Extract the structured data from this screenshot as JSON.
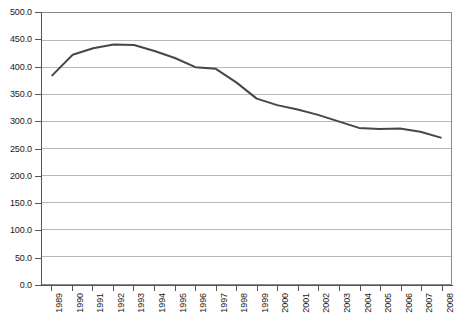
{
  "chart_data": {
    "type": "line",
    "title": "",
    "subtitle": "",
    "xlabel": "",
    "ylabel": "",
    "categories": [
      "1989",
      "1990",
      "1991",
      "1992",
      "1993",
      "1994",
      "1995",
      "1996",
      "1997",
      "1998",
      "1999",
      "2000",
      "2001",
      "2002",
      "2003",
      "2004",
      "2005",
      "2006",
      "2007",
      "2008"
    ],
    "values": [
      385.0,
      423.0,
      435.0,
      442.0,
      441.0,
      430.0,
      417.0,
      400.0,
      397.0,
      372.0,
      342.0,
      330.0,
      322.0,
      312.0,
      300.0,
      288.0,
      286.0,
      287.0,
      281.0,
      270.0
    ],
    "series": [
      {
        "name": "series-1",
        "values": [
          385.0,
          423.0,
          435.0,
          442.0,
          441.0,
          430.0,
          417.0,
          400.0,
          397.0,
          372.0,
          342.0,
          330.0,
          322.0,
          312.0,
          300.0,
          288.0,
          286.0,
          287.0,
          281.0,
          270.0
        ]
      }
    ],
    "ylim": [
      0,
      500
    ],
    "ytick_values": [
      0.0,
      50.0,
      100.0,
      150.0,
      200.0,
      250.0,
      300.0,
      350.0,
      400.0,
      450.0,
      500.0
    ],
    "ytick_labels": [
      "0.0",
      "50.0",
      "100.0",
      "150.0",
      "200.0",
      "250.0",
      "300.0",
      "350.0",
      "400.0",
      "450.0",
      "500.0"
    ],
    "grid": true,
    "grid_axis": "y",
    "legend": false,
    "legend_position": "none",
    "line_color": "#474747",
    "grid_color": "#b8b8b8",
    "axis_color": "#555555",
    "plot_background": "#ffffff",
    "line_width": 2
  }
}
